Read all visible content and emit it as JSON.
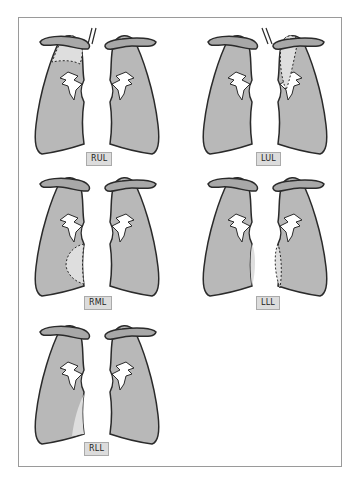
{
  "figure": {
    "title": "",
    "panels": [
      {
        "id": "rul",
        "label": "RUL",
        "desc": "Right upper lobe collapse"
      },
      {
        "id": "lul",
        "label": "LUL",
        "desc": "Left upper lobe collapse"
      },
      {
        "id": "rml",
        "label": "RML",
        "desc": "Right middle lobe collapse"
      },
      {
        "id": "lll",
        "label": "LLL",
        "desc": "Left lower lobe collapse"
      },
      {
        "id": "rll",
        "label": "RLL",
        "desc": "Right lower lobe collapse"
      }
    ]
  },
  "colors": {
    "lung_fill": "#b8b8b8",
    "collapse_fill": "#dedede",
    "outline": "#2a2a2a",
    "clavicle_fill": "#a8a8a8",
    "frame_border": "#9a9a9a",
    "label_bg": "#dcdcdc"
  }
}
